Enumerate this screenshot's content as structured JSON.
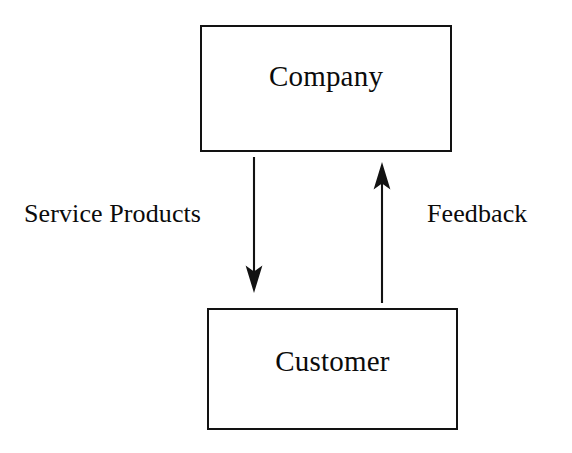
{
  "diagram": {
    "background_color": "#ffffff",
    "line_color": "#121212",
    "text_color": "#0b0b0b",
    "nodes": [
      {
        "id": "company",
        "label": "Company",
        "shape": "rectangle",
        "x": 200,
        "y": 25,
        "width": 252,
        "height": 127
      },
      {
        "id": "customer",
        "label": "Customer",
        "shape": "rectangle",
        "x": 207,
        "y": 308,
        "width": 251,
        "height": 122
      }
    ],
    "edges": [
      {
        "id": "service-products",
        "label": "Service Products",
        "from": "company",
        "to": "customer",
        "direction": "down",
        "x": 254,
        "y_start": 157,
        "y_end": 292,
        "label_x": 24,
        "label_y": 201
      },
      {
        "id": "feedback",
        "label": "Feedback",
        "from": "customer",
        "to": "company",
        "direction": "up",
        "x": 382,
        "y_start": 303,
        "y_end": 162,
        "label_x": 427,
        "label_y": 201
      }
    ]
  }
}
